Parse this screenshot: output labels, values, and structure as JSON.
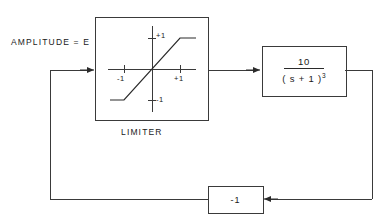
{
  "diagram": {
    "type": "control-system-block-diagram",
    "background_color": "#ffffff",
    "line_color": "#3a3a3a",
    "text_color": "#1a1a1a",
    "input": {
      "label": "AMPLITUDE = E"
    },
    "limiter_block": {
      "caption": "LIMITER",
      "curve": {
        "y_axis_positive_tick": "+1",
        "y_axis_negative_tick": "-1",
        "x_axis_negative_tick": "-1",
        "x_axis_positive_tick": "+1",
        "description": "saturation / limiter characteristic"
      }
    },
    "transfer_function_block": {
      "numerator": "10",
      "denominator": "( s + 1 )",
      "denominator_exponent": "3",
      "full": "10 / (s + 1)^3"
    },
    "feedback_block": {
      "gain": "-1"
    }
  }
}
